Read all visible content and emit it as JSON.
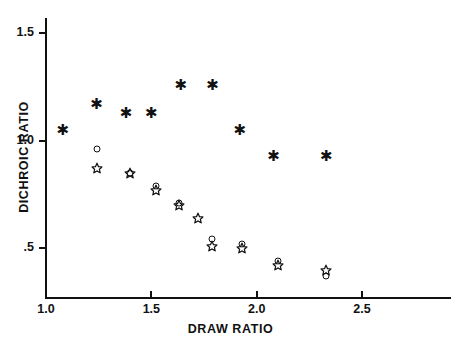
{
  "chart_data": {
    "type": "scatter",
    "title": "",
    "xlabel": "DRAW  RATIO",
    "ylabel": "DICHROIC  RATIO",
    "xlim": [
      0.92,
      2.85
    ],
    "ylim": [
      0.3,
      1.63
    ],
    "xticks": [
      "1.0",
      "1.5",
      "2.0",
      "2.5"
    ],
    "xtick_values": [
      1.0,
      1.5,
      2.0,
      2.5
    ],
    "yticks": [
      "1.5",
      "1.0",
      ".5"
    ],
    "ytick_values": [
      1.5,
      1.0,
      0.5
    ],
    "grid": false,
    "legend": "none",
    "series": [
      {
        "name": "asterisk",
        "marker": "asterisk",
        "points": [
          {
            "x": 1.08,
            "y": 1.05
          },
          {
            "x": 1.24,
            "y": 1.17
          },
          {
            "x": 1.38,
            "y": 1.13
          },
          {
            "x": 1.5,
            "y": 1.13
          },
          {
            "x": 1.64,
            "y": 1.26
          },
          {
            "x": 1.79,
            "y": 1.26
          },
          {
            "x": 1.92,
            "y": 1.05
          },
          {
            "x": 2.08,
            "y": 0.93
          },
          {
            "x": 2.33,
            "y": 0.93
          }
        ]
      },
      {
        "name": "open-circle",
        "marker": "circle",
        "points": [
          {
            "x": 1.24,
            "y": 0.96
          },
          {
            "x": 1.4,
            "y": 0.85
          },
          {
            "x": 1.52,
            "y": 0.79
          },
          {
            "x": 1.63,
            "y": 0.71
          },
          {
            "x": 1.79,
            "y": 0.54
          },
          {
            "x": 1.93,
            "y": 0.52
          },
          {
            "x": 2.1,
            "y": 0.44
          },
          {
            "x": 2.33,
            "y": 0.37
          }
        ]
      },
      {
        "name": "open-star",
        "marker": "star",
        "points": [
          {
            "x": 1.24,
            "y": 0.87
          },
          {
            "x": 1.4,
            "y": 0.85
          },
          {
            "x": 1.52,
            "y": 0.77
          },
          {
            "x": 1.63,
            "y": 0.7
          },
          {
            "x": 1.72,
            "y": 0.64
          },
          {
            "x": 1.79,
            "y": 0.51
          },
          {
            "x": 1.93,
            "y": 0.5
          },
          {
            "x": 2.1,
            "y": 0.42
          },
          {
            "x": 2.33,
            "y": 0.4
          }
        ]
      }
    ]
  },
  "colors": {
    "axis": "#111111",
    "marker": "#111111",
    "background": "#ffffff"
  }
}
